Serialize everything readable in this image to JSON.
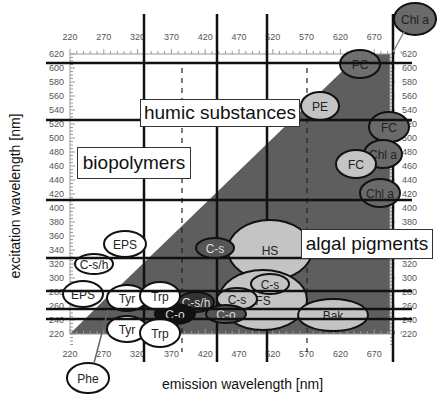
{
  "chart_data": {
    "type": "diagram",
    "title": "",
    "xlabel": "emission wavelength [nm]",
    "ylabel": "excitation wavelength [nm]",
    "x_ticks": [
      "220",
      "270",
      "320",
      "370",
      "420",
      "470",
      "520",
      "570",
      "620",
      "670"
    ],
    "y_ticks": [
      "620",
      "600",
      "580",
      "560",
      "540",
      "520",
      "500",
      "480",
      "460",
      "440",
      "420",
      "400",
      "380",
      "360",
      "340",
      "320",
      "300",
      "280",
      "260",
      "240",
      "220"
    ],
    "xlim": [
      220,
      690
    ],
    "ylim": [
      220,
      625
    ],
    "regions": [
      {
        "label": "humic substances",
        "type": "text-box"
      },
      {
        "label": "biopolymers",
        "type": "text-box"
      },
      {
        "label": "algal pigments",
        "type": "text-box"
      }
    ],
    "components": [
      {
        "label": "Chl a",
        "ex": 640,
        "em": 690,
        "shade": "dark"
      },
      {
        "label": "PC",
        "ex": 605,
        "em": 640,
        "shade": "dark"
      },
      {
        "label": "PE",
        "ex": 545,
        "em": 565,
        "shade": "light"
      },
      {
        "label": "FC",
        "ex": 520,
        "em": 675,
        "shade": "dark"
      },
      {
        "label": "Chl a",
        "ex": 480,
        "em": 670,
        "shade": "dark"
      },
      {
        "label": "FC",
        "ex": 460,
        "em": 645,
        "shade": "light"
      },
      {
        "label": "Chl a",
        "ex": 420,
        "em": 670,
        "shade": "dark"
      },
      {
        "label": "HS",
        "ex": 340,
        "em": 490,
        "shade": "light"
      },
      {
        "label": "C-s",
        "ex": 340,
        "em": 430,
        "shade": "dark"
      },
      {
        "label": "C-s",
        "ex": 295,
        "em": 525,
        "shade": "light"
      },
      {
        "label": "C-s",
        "ex": 270,
        "em": 465,
        "shade": "light"
      },
      {
        "label": "FS",
        "ex": 250,
        "em": 510,
        "shade": "light"
      },
      {
        "label": "C-o",
        "ex": 250,
        "em": 445,
        "shade": "dark"
      },
      {
        "label": "C-s/h",
        "ex": 262,
        "em": 400,
        "shade": "dark"
      },
      {
        "label": "C-o",
        "ex": 250,
        "em": 380,
        "shade": "black"
      },
      {
        "label": "Bak",
        "ex": 250,
        "em": 620,
        "shade": "light"
      },
      {
        "label": "EPS",
        "ex": 345,
        "em": 298,
        "shade": "white"
      },
      {
        "label": "C-s/h",
        "ex": 322,
        "em": 265,
        "shade": "white"
      },
      {
        "label": "EPS",
        "ex": 280,
        "em": 252,
        "shade": "white"
      },
      {
        "label": "Tyr",
        "ex": 275,
        "em": 305,
        "shade": "white"
      },
      {
        "label": "Trp",
        "ex": 280,
        "em": 350,
        "shade": "white"
      },
      {
        "label": "Tyr",
        "ex": 230,
        "em": 305,
        "shade": "white"
      },
      {
        "label": "Trp",
        "ex": 225,
        "em": 350,
        "shade": "white"
      },
      {
        "label": "Phe",
        "ex": 170,
        "em": 250,
        "shade": "white"
      }
    ],
    "grid": "selected lines only",
    "legend": "none"
  },
  "labels": {
    "xlabel": "emission wavelength [nm]",
    "ylabel": "excitation wavelength [nm]",
    "humic": "humic substances",
    "bio": "biopolymers",
    "algal": "algal pigments"
  },
  "ellipses": [
    {
      "label": "Chl a",
      "cx": 415,
      "cy": 19,
      "rx": 21,
      "ry": 16,
      "fill": "#6a6a6a"
    },
    {
      "label": "PC",
      "cx": 360,
      "cy": 64,
      "rx": 20,
      "ry": 14,
      "fill": "#6e6e6e"
    },
    {
      "label": "PE",
      "cx": 320,
      "cy": 106,
      "rx": 19,
      "ry": 14,
      "fill": "#c4c4c4"
    },
    {
      "label": "FC",
      "cx": 389,
      "cy": 127,
      "rx": 20,
      "ry": 15,
      "fill": "#6a6a6a"
    },
    {
      "label": "Chl a",
      "cx": 383,
      "cy": 154,
      "rx": 19,
      "ry": 14,
      "fill": "#6a6a6a"
    },
    {
      "label": "FC",
      "cx": 356,
      "cy": 164,
      "rx": 20,
      "ry": 14,
      "fill": "#c4c4c4"
    },
    {
      "label": "Chl a",
      "cx": 380,
      "cy": 193,
      "rx": 20,
      "ry": 14,
      "fill": "#6a6a6a"
    },
    {
      "label": "HS",
      "cx": 270,
      "cy": 250,
      "rx": 42,
      "ry": 30,
      "fill": "#c4c4c4"
    },
    {
      "label": "C-s",
      "cx": 215,
      "cy": 248,
      "rx": 19,
      "ry": 10,
      "fill": "#555"
    },
    {
      "label": "FS",
      "cx": 263,
      "cy": 300,
      "rx": 44,
      "ry": 30,
      "fill": "#c4c4c4"
    },
    {
      "label": "C-s",
      "cx": 270,
      "cy": 284,
      "rx": 19,
      "ry": 10,
      "fill": "#c4c4c4"
    },
    {
      "label": "C-s",
      "cx": 237,
      "cy": 299,
      "rx": 20,
      "ry": 11,
      "fill": "#c4c4c4"
    },
    {
      "label": "C-o",
      "cx": 226,
      "cy": 314,
      "rx": 20,
      "ry": 9,
      "fill": "#555"
    },
    {
      "label": "Bak",
      "cx": 333,
      "cy": 315,
      "rx": 35,
      "ry": 16,
      "fill": "#c4c4c4"
    },
    {
      "label": "C-s/h",
      "cx": 196,
      "cy": 302,
      "rx": 18,
      "ry": 10,
      "fill": "#333"
    },
    {
      "label": "C-o",
      "cx": 175,
      "cy": 314,
      "rx": 20,
      "ry": 10,
      "fill": "#111"
    },
    {
      "label": "EPS",
      "cx": 125,
      "cy": 244,
      "rx": 21,
      "ry": 13,
      "fill": "#fff"
    },
    {
      "label": "C-s/h",
      "cx": 94,
      "cy": 264,
      "rx": 19,
      "ry": 10,
      "fill": "#fff"
    },
    {
      "label": "EPS",
      "cx": 83,
      "cy": 294,
      "rx": 20,
      "ry": 13,
      "fill": "#fff"
    },
    {
      "label": "Tyr",
      "cx": 127,
      "cy": 298,
      "rx": 20,
      "ry": 13,
      "fill": "#fff"
    },
    {
      "label": "Trp",
      "cx": 160,
      "cy": 296,
      "rx": 20,
      "ry": 14,
      "fill": "#fff"
    },
    {
      "label": "Tyr",
      "cx": 127,
      "cy": 329,
      "rx": 20,
      "ry": 13,
      "fill": "#fff"
    },
    {
      "label": "Trp",
      "cx": 160,
      "cy": 333,
      "rx": 20,
      "ry": 14,
      "fill": "#fff"
    },
    {
      "label": "Phe",
      "cx": 88,
      "cy": 378,
      "rx": 21,
      "ry": 15,
      "fill": "#fff"
    }
  ]
}
